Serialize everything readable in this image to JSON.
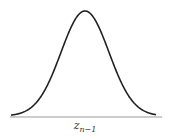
{
  "diagram": {
    "type": "gaussian-distribution",
    "axis_label": {
      "var": "z",
      "subscript": "n−1"
    },
    "curve": {
      "color": "#222222",
      "mean_x": 85,
      "peak_y": 11,
      "baseline_y": 117,
      "x_start": 11,
      "x_end": 156,
      "sigma_px": 24
    },
    "baseline": {
      "color": "#999999",
      "x_start": 10,
      "x_end": 162
    }
  }
}
